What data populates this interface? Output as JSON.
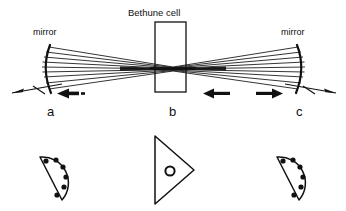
{
  "figure": {
    "title": "Bethune cell",
    "labels": {
      "mirror_left": "mirror",
      "mirror_right": "mirror",
      "stage_a": "a",
      "stage_b": "b",
      "stage_c": "c"
    },
    "colors": {
      "ink": "#111111",
      "background": "#ffffff"
    },
    "elements": {
      "mirror_left": "concave-mirror-arc-left",
      "mirror_right": "concave-mirror-arc-right",
      "cell": "bethune-cell-rectangle",
      "beam": "converging-ray-bundle",
      "arrow_a": "leftward-propagation-arrow",
      "arrow_b": "leftward-propagation-arrow",
      "arrow_c": "rightward-propagation-arrow",
      "profile_a": "half-disc-beam-profile-with-dots",
      "profile_b": "triangle-beam-profile-with-ring",
      "profile_c": "half-disc-beam-profile-with-dots"
    },
    "beam_profiles": {
      "left": {
        "shape": "half-disc",
        "dot_count": 6
      },
      "center": {
        "shape": "triangle",
        "ring_count": 1
      },
      "right": {
        "shape": "half-disc",
        "dot_count": 6
      }
    },
    "ray_count": 9
  }
}
